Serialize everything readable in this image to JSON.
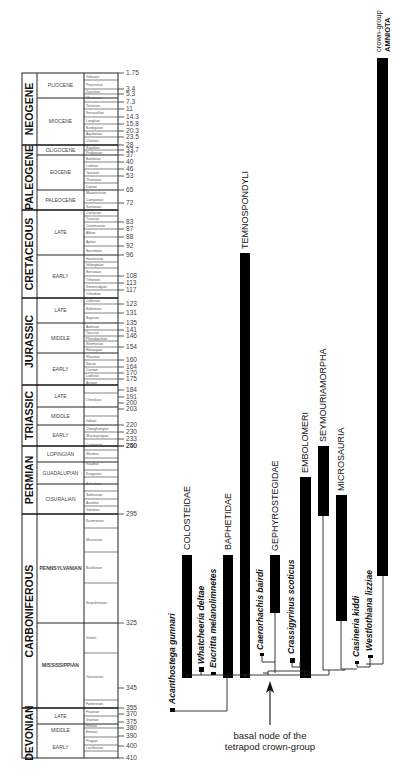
{
  "timescale": {
    "periods": [
      {
        "label": "NEOGENE",
        "top": 1.75,
        "bottom": 23.5
      },
      {
        "label": "PALEOGENE",
        "top": 23.5,
        "bottom": 65
      },
      {
        "label": "CRETACEOUS",
        "top": 65,
        "bottom": 135
      },
      {
        "label": "JURASSIC",
        "top": 135,
        "bottom": 203
      },
      {
        "label": "TRIASSIC",
        "top": 203,
        "bottom": 250
      },
      {
        "label": "PERMIAN",
        "top": 250,
        "bottom": 295
      },
      {
        "label": "CARBONIFEROUS",
        "top": 295,
        "bottom": 355
      },
      {
        "label": "DEVONIAN",
        "top": 355,
        "bottom": 410
      }
    ],
    "epochs": [
      {
        "label": "PLIOCENE",
        "top": 1.75,
        "bottom": 5.3
      },
      {
        "label": "MIOCENE",
        "top": 5.3,
        "bottom": 23.5
      },
      {
        "label": "OLIGOCENE",
        "top": 23.5,
        "bottom": 33.7
      },
      {
        "label": "EOCENE",
        "top": 33.7,
        "bottom": 53
      },
      {
        "label": "PALEOCENE",
        "top": 53,
        "bottom": 65
      },
      {
        "label": "LATE",
        "top": 65,
        "bottom": 96
      },
      {
        "label": "EARLY",
        "top": 96,
        "bottom": 135
      },
      {
        "label": "LATE",
        "top": 135,
        "bottom": 154
      },
      {
        "label": "MIDDLE",
        "top": 154,
        "bottom": 175
      },
      {
        "label": "EARLY",
        "top": 175,
        "bottom": 203
      },
      {
        "label": "LATE",
        "top": 203,
        "bottom": 230
      },
      {
        "label": "MIDDLE",
        "top": 230,
        "bottom": 240
      },
      {
        "label": "EARLY",
        "top": 240,
        "bottom": 250
      },
      {
        "label": "LOPINGIAN",
        "top": 250,
        "bottom": 256
      },
      {
        "label": "GUADALUPIAN",
        "top": 256,
        "bottom": 270
      },
      {
        "label": "CISURALIAN",
        "top": 270,
        "bottom": 295
      },
      {
        "label": "PENNSYLVANIAN",
        "top": 295,
        "bottom": 320
      },
      {
        "label": "MISSISSIPPIAN",
        "top": 320,
        "bottom": 355
      },
      {
        "label": "LATE",
        "top": 355,
        "bottom": 375
      },
      {
        "label": "MIDDLE",
        "top": 375,
        "bottom": 390
      },
      {
        "label": "EARLY",
        "top": 390,
        "bottom": 410
      }
    ],
    "stages": [
      "Gelasian",
      "Piacenzian",
      "Zanclean",
      "Messinian",
      "Tortonian",
      "Serravallian",
      "Langhian",
      "Burdigalian",
      "Aquitanian",
      "Chattian",
      "Rupelian",
      "Priabonian",
      "Bartonian",
      "Lutetian",
      "Ypresian",
      "Thanetian",
      "Danian",
      "Maastrichtian",
      "Campanian",
      "Santonian",
      "Coniacian",
      "Turonian",
      "Cenomanian",
      "Albian",
      "Aptian",
      "Barremian",
      "Hauterivian",
      "Valanginian",
      "Berriasian",
      "Tithonian",
      "Kimmeridgian",
      "Oxfordian",
      "Callovian",
      "Bathonian",
      "Bajocian",
      "Aalenian",
      "Toarcian",
      "Pliensbachian",
      "Sinemurian",
      "Hettangian",
      "Rhaetian",
      "Norian",
      "Carnian",
      "Ladinian",
      "Anisian",
      "Olenekian",
      "Induan",
      "Changhsingian",
      "Wuchiapingian",
      "Capitanian",
      "Wordian",
      "Roadian",
      "Kungurian",
      "Artinskian",
      "Sakmarian",
      "Asselian",
      "Gzhelian",
      "Kasimovian",
      "Moscovian",
      "Bashkirian",
      "Serpukhovian",
      "Visean",
      "Tournaisian",
      "Famennian",
      "Frasnian",
      "Givetian",
      "Eifelian",
      "Emsian",
      "Pragian",
      "Lochkovian"
    ],
    "ages_ma": [
      "1.75",
      "3.4",
      "5.3",
      "7.3",
      "11",
      "14.3",
      "15.8",
      "20.3",
      "23.5",
      "28",
      "33.7",
      "37",
      "40",
      "46",
      "53",
      "65",
      "72",
      "83",
      "87",
      "88",
      "92",
      "96",
      "108",
      "113",
      "117",
      "123",
      "131",
      "135",
      "141",
      "146",
      "154",
      "160",
      "164",
      "170",
      "175",
      "184",
      "191",
      "200",
      "203",
      "220",
      "230",
      "233",
      "240",
      "250",
      "295",
      "325",
      "345",
      "355",
      "370",
      "375",
      "380",
      "390",
      "400",
      "410"
    ]
  },
  "phylogeny": {
    "taxa": [
      {
        "label": "Acanthostega gunnari",
        "italic": true
      },
      {
        "label": "COLOSTEIDAE",
        "italic": false
      },
      {
        "label": "Whatcheeria deltae",
        "italic": true
      },
      {
        "label": "Eucritta melanolimnetes",
        "italic": true
      },
      {
        "label": "BAPHETIDAE",
        "italic": false
      },
      {
        "label": "TEMNOSPONDYLI",
        "italic": false
      },
      {
        "label": "Caerorhachis bairdi",
        "italic": true
      },
      {
        "label": "GEPHYROSTEGIDAE",
        "italic": false
      },
      {
        "label": "Crassigyrinus scoticus",
        "italic": true
      },
      {
        "label": "EMBOLOMERI",
        "italic": false
      },
      {
        "label": "SEYMOURIAMORPHA",
        "italic": false
      },
      {
        "label": "MICROSAURIA",
        "italic": false
      },
      {
        "label": "Casineria kiddi",
        "italic": true
      },
      {
        "label": "Westlothiana lizziae",
        "italic": true
      },
      {
        "label": "crown-group AMNIOTA",
        "italic": false
      }
    ],
    "annotation": {
      "line1": "basal node of the",
      "line2": "tetrapod crown-group"
    },
    "crown_label": {
      "line1": "crown-group",
      "line2": "AMNIOTA"
    }
  }
}
